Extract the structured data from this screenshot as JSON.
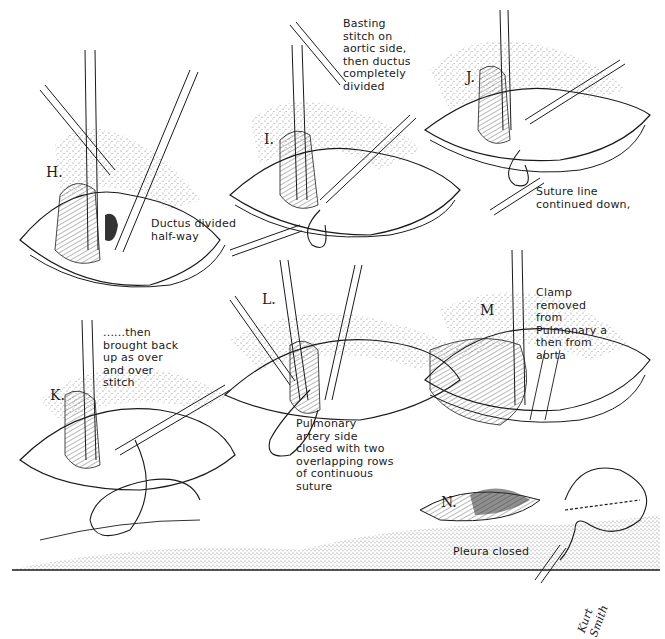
{
  "figure": {
    "type": "surgical illustration",
    "panels": [
      {
        "id": "H",
        "label": "H.",
        "caption": "Ductus divided\nhalf-way"
      },
      {
        "id": "I",
        "label": "I.",
        "caption": "Basting\nstitch on\naortic side,\nthen ductus\ncompletely\ndivided"
      },
      {
        "id": "J",
        "label": "J.",
        "caption": "Suture line\ncontinued down,"
      },
      {
        "id": "K",
        "label": "K.",
        "caption": "......then\nbrought back\nup as over\nand over\nstitch"
      },
      {
        "id": "L",
        "label": "L.",
        "caption": "Pulmonary\nartery side\nclosed with two\noverlapping rows\nof continuous\nsuture"
      },
      {
        "id": "M",
        "label": "M",
        "caption": "Clamp\nremoved\nfrom\nPulmonary a\nthen from\naorta"
      },
      {
        "id": "N",
        "label": "N.",
        "caption": "Pleura closed"
      }
    ],
    "signature": "Kurt\nSmith",
    "colors": {
      "ink": "#1a1a1a",
      "paper": "#ffffff",
      "stipple": "#555555"
    }
  }
}
